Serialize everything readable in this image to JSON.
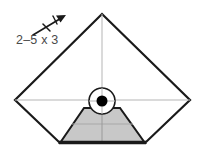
{
  "diagram": {
    "background_color": "#ffffff",
    "annotation": {
      "label": "2–5 x 3",
      "text_color": "#4a4a4a",
      "arrow_icon": "direction-arrow-icon",
      "arrow_color": "#1a1a1a"
    },
    "shapes": {
      "kite_outline": {
        "name": "kite-outline",
        "stroke_color": "#1a1a1a",
        "fill_color": "#ffffff",
        "points": "102,14 190,100 145,143 60,143 15,100"
      },
      "trapezoid": {
        "name": "shaded-trapezoid",
        "fill_color": "#c8c8c8",
        "stroke_color": "#1a1a1a",
        "points": "84,108 120,108 145,143 60,143"
      },
      "base_line": {
        "name": "thick-base-line",
        "stroke_color": "#1a1a1a",
        "x1": 60,
        "y1": 143,
        "x2": 145,
        "y2": 143
      },
      "center_circle": {
        "name": "center-circle",
        "cx": 102,
        "cy": 101,
        "r": 13,
        "stroke_color": "#1a1a1a",
        "fill_color": "#ffffff"
      },
      "center_dot": {
        "name": "center-dot",
        "cx": 102,
        "cy": 101,
        "r": 5.5,
        "fill_color": "#000000"
      }
    },
    "guides": {
      "color": "#b5b5b5",
      "horizontal_main": {
        "name": "horizontal-axis-guide",
        "x1": 15,
        "y1": 100,
        "x2": 190,
        "y2": 100
      },
      "vertical_main": {
        "name": "vertical-axis-guide",
        "x1": 102,
        "y1": 14,
        "x2": 102,
        "y2": 143
      },
      "horizontal_lower": {
        "name": "lower-horizontal-guide",
        "x1": 72,
        "y1": 124,
        "x2": 133,
        "y2": 124
      }
    }
  }
}
